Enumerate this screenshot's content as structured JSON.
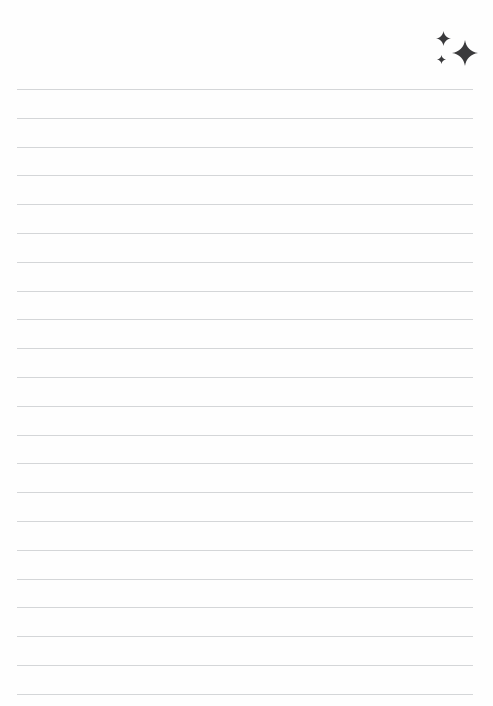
{
  "page": {
    "width": 493,
    "height": 706,
    "background_color": "#fefefe",
    "kind": "blank-lined-note-page"
  },
  "ruled_lines": {
    "count": 22,
    "color": "#d4d6d8",
    "thickness_px": 1,
    "first_line_y": 89,
    "spacing_px": 28.8,
    "left_x": 17,
    "right_x": 473
  },
  "sparkle_cluster": {
    "color": "#3a3a3c",
    "label": "sparkles",
    "origin": {
      "x": 428,
      "y": 22
    },
    "stars": [
      {
        "name": "sparkle-medium",
        "x": 8,
        "y": 9,
        "size": 15
      },
      {
        "name": "sparkle-large",
        "x": 24,
        "y": 18,
        "size": 26
      },
      {
        "name": "sparkle-small",
        "x": 9,
        "y": 33,
        "size": 9
      }
    ]
  }
}
